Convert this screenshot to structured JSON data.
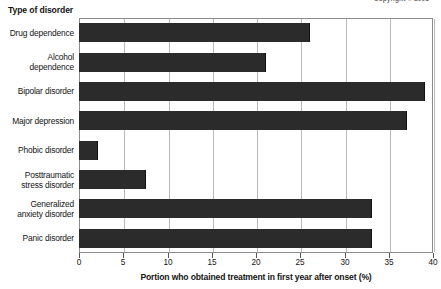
{
  "credit": {
    "text": "Copyright © 2001"
  },
  "labels": {
    "category_axis_title": "Type of disorder",
    "value_axis_title": "Portion who obtained treatment in first year after onset (%)"
  },
  "colors": {
    "bar": "#2b2b2b",
    "grid": "#b9b9b9",
    "frame": "#8c8c8c",
    "text": "#141414"
  },
  "chart_data": {
    "type": "bar",
    "orientation": "horizontal",
    "title": "",
    "xlabel": "Portion who obtained treatment in first year after onset (%)",
    "ylabel": "Type of disorder",
    "xlim": [
      0,
      40
    ],
    "xticks": [
      0,
      5,
      10,
      15,
      20,
      25,
      30,
      35,
      40
    ],
    "xtick_labels": [
      "0",
      "5",
      "10",
      "15",
      "20",
      "25",
      "30",
      "35",
      "40"
    ],
    "grid": true,
    "legend": "none",
    "categories": [
      "Drug dependence",
      "Alcohol dependence",
      "Bipolar disorder",
      "Major depression",
      "Phobic disorder",
      "Posttraumatic stress disorder",
      "Generalized anxiety disorder",
      "Panic disorder"
    ],
    "values": [
      26,
      21,
      39,
      37,
      2,
      7.5,
      33,
      33
    ],
    "series": [
      {
        "name": "Portion who obtained treatment in first year after onset (%)",
        "values": [
          26,
          21,
          39,
          37,
          2,
          7.5,
          33,
          33
        ]
      }
    ]
  }
}
